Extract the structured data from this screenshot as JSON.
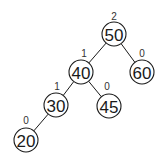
{
  "diagram": {
    "type": "avl-tree",
    "colors": {
      "stroke": "#1a1a1a",
      "background": "#ffffff",
      "label": "#333333"
    },
    "node_radius": 12,
    "nodes": [
      {
        "id": "n50",
        "value": "50",
        "balance": "2",
        "cx": 114,
        "cy": 34,
        "bx": 114,
        "by": 20
      },
      {
        "id": "n40",
        "value": "40",
        "balance": "1",
        "cx": 81,
        "cy": 72,
        "bx": 84,
        "by": 57
      },
      {
        "id": "n60",
        "value": "60",
        "balance": "0",
        "cx": 142,
        "cy": 72,
        "bx": 142,
        "by": 57
      },
      {
        "id": "n30",
        "value": "30",
        "balance": "1",
        "cx": 56,
        "cy": 105,
        "bx": 57,
        "by": 90
      },
      {
        "id": "n45",
        "value": "45",
        "balance": "0",
        "cx": 109,
        "cy": 106,
        "bx": 107,
        "by": 90
      },
      {
        "id": "n20",
        "value": "20",
        "balance": "0",
        "cx": 26,
        "cy": 140,
        "bx": 26,
        "by": 124
      }
    ],
    "edges": [
      {
        "from": "n50",
        "to": "n40"
      },
      {
        "from": "n50",
        "to": "n60"
      },
      {
        "from": "n40",
        "to": "n30"
      },
      {
        "from": "n40",
        "to": "n45"
      },
      {
        "from": "n30",
        "to": "n20"
      }
    ]
  }
}
